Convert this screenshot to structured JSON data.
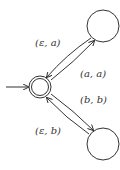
{
  "diagram": {
    "type": "automaton",
    "states": [
      {
        "id": "q0",
        "initial": true,
        "accepting": true
      },
      {
        "id": "q1",
        "initial": false,
        "accepting": false
      },
      {
        "id": "q2",
        "initial": false,
        "accepting": false
      }
    ],
    "transitions": [
      {
        "from": "q1",
        "to": "q0",
        "label": "(ε, a)"
      },
      {
        "from": "q0",
        "to": "q1",
        "label": "(a, a)"
      },
      {
        "from": "q0",
        "to": "q2",
        "label": "(b, b)"
      },
      {
        "from": "q2",
        "to": "q0",
        "label": "(ε, b)"
      }
    ],
    "labels": {
      "t1": "(ε, a)",
      "t2": "(a, a)",
      "t3": "(b, b)",
      "t4": "(ε, b)"
    },
    "colors": {
      "stroke": "#333333",
      "background": "#ffffff"
    }
  }
}
